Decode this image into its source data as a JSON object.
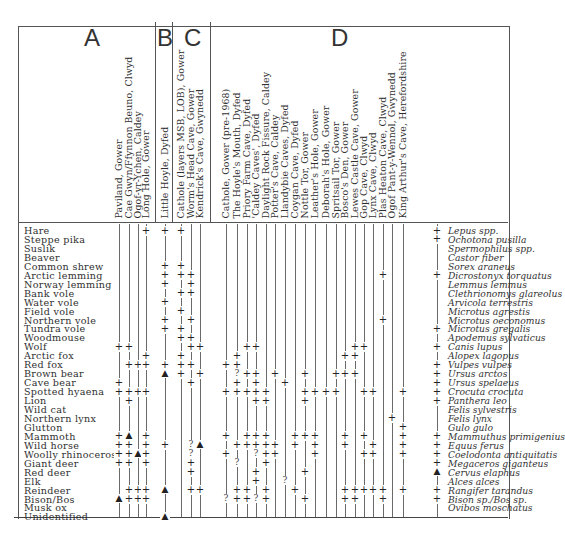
{
  "groups": [
    {
      "id": "A",
      "label": "A",
      "x": 94
    },
    {
      "id": "B",
      "label": "B",
      "x": 160
    },
    {
      "id": "C",
      "label": "C",
      "x": 183
    },
    {
      "id": "D",
      "label": "D",
      "x": 335
    }
  ],
  "sites": [
    {
      "group": "A",
      "name": "Paviland, Gower",
      "x": 119
    },
    {
      "group": "A",
      "name": "Cae Gwyn/Ffynnon Beuno, Clwyd",
      "x": 129
    },
    {
      "group": "A",
      "name": "Ogof-yr-Ychen, Caldey",
      "x": 138
    },
    {
      "group": "A",
      "name": "Long Hole, Gower",
      "x": 146
    },
    {
      "group": "B",
      "name": "Little Hoyle, Dyfed",
      "x": 165
    },
    {
      "group": "C",
      "name": "Cathole (layers MSB, LOB), Gower",
      "x": 181
    },
    {
      "group": "C",
      "name": "Worm's Head Cave, Gower",
      "x": 191
    },
    {
      "group": "C",
      "name": "Kendrick's Cave, Gwynedd",
      "x": 200
    },
    {
      "group": "D",
      "name": "Cathole, Gower (pre-1968)",
      "x": 226
    },
    {
      "group": "D",
      "name": "The Hoyle's Mouth, Dyfed",
      "x": 237
    },
    {
      "group": "D",
      "name": "Priory Farm Cave, Dyfed",
      "x": 247
    },
    {
      "group": "D",
      "name": "'Caldey Caves', Dyfed",
      "x": 256
    },
    {
      "group": "D",
      "name": "Daylight Rock Fissure, Caldey",
      "x": 266
    },
    {
      "group": "D",
      "name": "Potter's Cave, Caldey",
      "x": 275
    },
    {
      "group": "D",
      "name": "Llandybie Caves, Dyfed",
      "x": 285
    },
    {
      "group": "D",
      "name": "Coygan Cave, Dyfed",
      "x": 295
    },
    {
      "group": "D",
      "name": "Nottle Tor, Gower",
      "x": 305
    },
    {
      "group": "D",
      "name": "Leather's Hole, Gower",
      "x": 315
    },
    {
      "group": "D",
      "name": "Deborah's Hole, Gower",
      "x": 326
    },
    {
      "group": "D",
      "name": "Spritsail Tor, Gower",
      "x": 336
    },
    {
      "group": "D",
      "name": "Bosco's Den, Gower",
      "x": 345
    },
    {
      "group": "D",
      "name": "Lewes Castle Cave, Gower",
      "x": 355
    },
    {
      "group": "D",
      "name": "Gop Cave, Clwyd",
      "x": 364
    },
    {
      "group": "D",
      "name": "Lynx Cave, Clwyd",
      "x": 373
    },
    {
      "group": "D",
      "name": "Plas Heaton Cave, Clwyd",
      "x": 383
    },
    {
      "group": "D",
      "name": "Ogof Pant-y-Wennol, Gwynedd",
      "x": 392
    },
    {
      "group": "D",
      "name": "King Arthur's Cave, Herefordshire",
      "x": 403
    }
  ],
  "species": [
    {
      "common": "Hare",
      "latin": "Lepus spp."
    },
    {
      "common": "Steppe pika",
      "latin": "Ochotona pusilla"
    },
    {
      "common": "Suslik",
      "latin": "Spermophilus spp."
    },
    {
      "common": "Beaver",
      "latin": "Castor fiber"
    },
    {
      "common": "Common shrew",
      "latin": "Sorex araneus"
    },
    {
      "common": "Arctic lemming",
      "latin": "Dicrostonyx torquatus"
    },
    {
      "common": "Norway lemming",
      "latin": "Lemmus lemmus"
    },
    {
      "common": "Bank vole",
      "latin": "Clethrionomys glareolus"
    },
    {
      "common": "Water vole",
      "latin": "Arvicola terrestris"
    },
    {
      "common": "Field vole",
      "latin": "Microtus agrestis"
    },
    {
      "common": "Northern vole",
      "latin": "Microtus oeconomus"
    },
    {
      "common": "Tundra vole",
      "latin": "Microtus gregalis"
    },
    {
      "common": "Woodmouse",
      "latin": "Apodemus sylvaticus"
    },
    {
      "common": "Wolf",
      "latin": "Canis lupus"
    },
    {
      "common": "Arctic fox",
      "latin": "Alopex lagopus"
    },
    {
      "common": "Red fox",
      "latin": "Vulpes vulpes"
    },
    {
      "common": "Brown bear",
      "latin": "Ursus arctos"
    },
    {
      "common": "Cave bear",
      "latin": "Ursus spelaeus"
    },
    {
      "common": "Spotted hyaena",
      "latin": "Crocuta crocuta"
    },
    {
      "common": "Lion",
      "latin": "Panthera leo"
    },
    {
      "common": "Wild cat",
      "latin": "Felis sylvestris"
    },
    {
      "common": "Northern lynx",
      "latin": "Felis lynx"
    },
    {
      "common": "Glutton",
      "latin": "Gulo gulo"
    },
    {
      "common": "Mammoth",
      "latin": "Mammuthus primigenius"
    },
    {
      "common": "Wild horse",
      "latin": "Equus ferus"
    },
    {
      "common": "Woolly rhinoceros",
      "latin": "Coelodonta antiquitatis"
    },
    {
      "common": "Giant deer",
      "latin": "Megaceros giganteus"
    },
    {
      "common": "Red deer",
      "latin": "Cervus elaphus"
    },
    {
      "common": "Elk",
      "latin": "Alces alces"
    },
    {
      "common": "Reindeer",
      "latin": "Rangifer tarandus"
    },
    {
      "common": "Bison/Bos",
      "latin": "Bison sp./Bos sp."
    },
    {
      "common": "Musk ox",
      "latin": "Ovibos moschatus"
    },
    {
      "common": "Unidentified",
      "latin": ""
    }
  ],
  "legend_symbols": {
    "present": "+",
    "dated": "▲",
    "uncertain": "?"
  },
  "marks": [
    [
      0,
      3,
      "+"
    ],
    [
      0,
      4,
      "+"
    ],
    [
      0,
      5,
      "+"
    ],
    [
      0,
      27,
      "+"
    ],
    [
      1,
      27,
      "+"
    ],
    [
      4,
      4,
      "+"
    ],
    [
      4,
      5,
      "+"
    ],
    [
      5,
      4,
      "+"
    ],
    [
      5,
      5,
      "+"
    ],
    [
      5,
      6,
      "+"
    ],
    [
      5,
      24,
      "+"
    ],
    [
      5,
      27,
      "+"
    ],
    [
      6,
      4,
      "+"
    ],
    [
      6,
      6,
      "+"
    ],
    [
      7,
      5,
      "+"
    ],
    [
      7,
      6,
      "+"
    ],
    [
      8,
      4,
      "+"
    ],
    [
      9,
      5,
      "+"
    ],
    [
      10,
      4,
      "+"
    ],
    [
      10,
      6,
      "+"
    ],
    [
      10,
      24,
      "+"
    ],
    [
      11,
      4,
      "+"
    ],
    [
      11,
      5,
      "+"
    ],
    [
      11,
      27,
      "+"
    ],
    [
      12,
      5,
      "+"
    ],
    [
      12,
      6,
      "+"
    ],
    [
      13,
      0,
      "+"
    ],
    [
      13,
      1,
      "+"
    ],
    [
      13,
      6,
      "+"
    ],
    [
      13,
      7,
      "+"
    ],
    [
      13,
      10,
      "+"
    ],
    [
      13,
      11,
      "+"
    ],
    [
      13,
      21,
      "+"
    ],
    [
      13,
      22,
      "+"
    ],
    [
      13,
      27,
      "+"
    ],
    [
      14,
      3,
      "+"
    ],
    [
      14,
      5,
      "+"
    ],
    [
      14,
      9,
      "+"
    ],
    [
      14,
      20,
      "+"
    ],
    [
      14,
      21,
      "+"
    ],
    [
      15,
      1,
      "+"
    ],
    [
      15,
      2,
      "+"
    ],
    [
      15,
      3,
      "+"
    ],
    [
      15,
      4,
      "+"
    ],
    [
      15,
      5,
      "+"
    ],
    [
      15,
      6,
      "+"
    ],
    [
      15,
      8,
      "+"
    ],
    [
      15,
      9,
      "+"
    ],
    [
      15,
      27,
      "+"
    ],
    [
      16,
      4,
      "▲"
    ],
    [
      16,
      5,
      "+"
    ],
    [
      16,
      7,
      "+"
    ],
    [
      16,
      9,
      "?"
    ],
    [
      16,
      10,
      "+"
    ],
    [
      16,
      11,
      "+"
    ],
    [
      16,
      13,
      "+"
    ],
    [
      16,
      16,
      "+"
    ],
    [
      16,
      19,
      "+"
    ],
    [
      16,
      20,
      "+"
    ],
    [
      16,
      21,
      "+"
    ],
    [
      16,
      27,
      "+"
    ],
    [
      17,
      0,
      "+"
    ],
    [
      17,
      6,
      "+"
    ],
    [
      17,
      9,
      "+"
    ],
    [
      17,
      11,
      "+"
    ],
    [
      17,
      14,
      "+"
    ],
    [
      17,
      27,
      "+"
    ],
    [
      18,
      0,
      "+"
    ],
    [
      18,
      1,
      "+"
    ],
    [
      18,
      2,
      "+"
    ],
    [
      18,
      3,
      "+"
    ],
    [
      18,
      8,
      "+"
    ],
    [
      18,
      9,
      "+"
    ],
    [
      18,
      10,
      "+"
    ],
    [
      18,
      11,
      "+"
    ],
    [
      18,
      12,
      "+"
    ],
    [
      18,
      16,
      "+"
    ],
    [
      18,
      17,
      "+"
    ],
    [
      18,
      18,
      "+"
    ],
    [
      18,
      19,
      "+"
    ],
    [
      18,
      22,
      "+"
    ],
    [
      18,
      23,
      "+"
    ],
    [
      18,
      26,
      "+"
    ],
    [
      18,
      27,
      "+"
    ],
    [
      19,
      1,
      "+"
    ],
    [
      19,
      11,
      "+"
    ],
    [
      19,
      12,
      "+"
    ],
    [
      19,
      16,
      "+"
    ],
    [
      19,
      27,
      "+"
    ],
    [
      21,
      25,
      "+"
    ],
    [
      22,
      26,
      "+"
    ],
    [
      23,
      0,
      "+"
    ],
    [
      23,
      1,
      "▲"
    ],
    [
      23,
      3,
      "+"
    ],
    [
      23,
      8,
      "+"
    ],
    [
      23,
      10,
      "+"
    ],
    [
      23,
      11,
      "+"
    ],
    [
      23,
      12,
      "+"
    ],
    [
      23,
      15,
      "+"
    ],
    [
      23,
      16,
      "+"
    ],
    [
      23,
      17,
      "+"
    ],
    [
      23,
      20,
      "+"
    ],
    [
      23,
      22,
      "+"
    ],
    [
      23,
      26,
      "+"
    ],
    [
      23,
      27,
      "+"
    ],
    [
      24,
      0,
      "+"
    ],
    [
      24,
      1,
      "+"
    ],
    [
      24,
      3,
      "+"
    ],
    [
      24,
      4,
      "+"
    ],
    [
      24,
      6,
      "?"
    ],
    [
      24,
      7,
      "▲"
    ],
    [
      24,
      9,
      "+"
    ],
    [
      24,
      10,
      "+"
    ],
    [
      24,
      11,
      "+"
    ],
    [
      24,
      12,
      "+"
    ],
    [
      24,
      13,
      "+"
    ],
    [
      24,
      15,
      "+"
    ],
    [
      24,
      17,
      "+"
    ],
    [
      24,
      20,
      "+"
    ],
    [
      24,
      23,
      "+"
    ],
    [
      24,
      26,
      "+"
    ],
    [
      24,
      27,
      "+"
    ],
    [
      25,
      0,
      "+"
    ],
    [
      25,
      1,
      "+"
    ],
    [
      25,
      2,
      "▲"
    ],
    [
      25,
      3,
      "+"
    ],
    [
      25,
      6,
      "?"
    ],
    [
      25,
      8,
      "+"
    ],
    [
      25,
      11,
      "?"
    ],
    [
      25,
      12,
      "+"
    ],
    [
      25,
      13,
      "+"
    ],
    [
      25,
      17,
      "+"
    ],
    [
      25,
      22,
      "+"
    ],
    [
      25,
      23,
      "+"
    ],
    [
      25,
      26,
      "+"
    ],
    [
      25,
      27,
      "+"
    ],
    [
      26,
      0,
      "+"
    ],
    [
      26,
      1,
      "+"
    ],
    [
      26,
      3,
      "+"
    ],
    [
      26,
      6,
      "+"
    ],
    [
      26,
      9,
      "?"
    ],
    [
      26,
      12,
      "+"
    ],
    [
      26,
      27,
      "+"
    ],
    [
      27,
      6,
      "+"
    ],
    [
      27,
      11,
      "+"
    ],
    [
      27,
      16,
      "+"
    ],
    [
      27,
      27,
      "▲"
    ],
    [
      28,
      11,
      "+"
    ],
    [
      28,
      14,
      "?"
    ],
    [
      29,
      1,
      "+"
    ],
    [
      29,
      2,
      "+"
    ],
    [
      29,
      3,
      "+"
    ],
    [
      29,
      4,
      "▲"
    ],
    [
      29,
      6,
      "+"
    ],
    [
      29,
      7,
      "+"
    ],
    [
      29,
      9,
      "+"
    ],
    [
      29,
      10,
      "+"
    ],
    [
      29,
      12,
      "+"
    ],
    [
      29,
      15,
      "+"
    ],
    [
      29,
      20,
      "+"
    ],
    [
      29,
      21,
      "+"
    ],
    [
      29,
      22,
      "+"
    ],
    [
      29,
      23,
      "+"
    ],
    [
      29,
      24,
      "+"
    ],
    [
      29,
      26,
      "+"
    ],
    [
      29,
      27,
      "+"
    ],
    [
      30,
      0,
      "▲"
    ],
    [
      30,
      1,
      "+"
    ],
    [
      30,
      2,
      "+"
    ],
    [
      30,
      3,
      "+"
    ],
    [
      30,
      8,
      "?"
    ],
    [
      30,
      9,
      "+"
    ],
    [
      30,
      10,
      "+"
    ],
    [
      30,
      11,
      "?"
    ],
    [
      30,
      12,
      "+"
    ],
    [
      30,
      16,
      "+"
    ],
    [
      30,
      20,
      "+"
    ],
    [
      30,
      21,
      "+"
    ],
    [
      30,
      24,
      "+"
    ],
    [
      30,
      27,
      "+"
    ],
    [
      32,
      4,
      "▲"
    ]
  ]
}
